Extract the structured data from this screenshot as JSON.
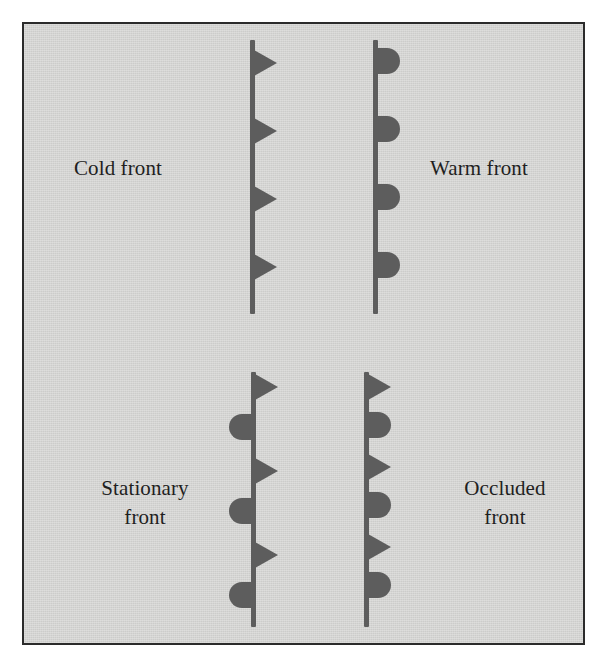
{
  "figure": {
    "background_color": "#d4d4d2",
    "border_color": "#2b2b2b",
    "symbol_color": "#5d5d5d",
    "text_color": "#1f1f1f"
  },
  "fronts": [
    {
      "id": "cold-front",
      "label": "Cold front",
      "label_lines": [
        "Cold front"
      ],
      "description": "Solid line with filled triangles (pips) on one side, pointing in the direction of motion.",
      "line": {
        "x": 248,
        "y_top": 38,
        "y_bottom": 312
      },
      "label_pos": {
        "x": 72,
        "y": 152,
        "align": "left"
      },
      "symbols": [
        {
          "shape": "triangle",
          "side": "right",
          "y": 48
        },
        {
          "shape": "triangle",
          "side": "right",
          "y": 116
        },
        {
          "shape": "triangle",
          "side": "right",
          "y": 184
        },
        {
          "shape": "triangle",
          "side": "right",
          "y": 252
        }
      ]
    },
    {
      "id": "warm-front",
      "label": "Warm front",
      "label_lines": [
        "Warm front"
      ],
      "description": "Solid line with filled semicircles on one side, facing the direction of motion.",
      "line": {
        "x": 371,
        "y_top": 38,
        "y_bottom": 312
      },
      "label_pos": {
        "x": 428,
        "y": 152,
        "align": "left"
      },
      "symbols": [
        {
          "shape": "semicircle",
          "side": "right",
          "y": 46
        },
        {
          "shape": "semicircle",
          "side": "right",
          "y": 114
        },
        {
          "shape": "semicircle",
          "side": "right",
          "y": 182
        },
        {
          "shape": "semicircle",
          "side": "right",
          "y": 250
        }
      ]
    },
    {
      "id": "stationary-front",
      "label": "Stationary front",
      "label_lines": [
        "Stationary",
        "front"
      ],
      "description": "Alternating triangles on one side and semicircles on the opposite side.",
      "line": {
        "x": 249,
        "y_top": 370,
        "y_bottom": 625
      },
      "label_pos": {
        "x": 68,
        "y": 472,
        "align": "center"
      },
      "symbols": [
        {
          "shape": "triangle",
          "side": "right",
          "y": 372
        },
        {
          "shape": "semicircle",
          "side": "left",
          "y": 412
        },
        {
          "shape": "triangle",
          "side": "right",
          "y": 456
        },
        {
          "shape": "semicircle",
          "side": "left",
          "y": 496
        },
        {
          "shape": "triangle",
          "side": "right",
          "y": 540
        },
        {
          "shape": "semicircle",
          "side": "left",
          "y": 580
        }
      ]
    },
    {
      "id": "occluded-front",
      "label": "Occluded front",
      "label_lines": [
        "Occluded",
        "front"
      ],
      "description": "Alternating triangles and semicircles on the same side of the line.",
      "line": {
        "x": 362,
        "y_top": 370,
        "y_bottom": 625
      },
      "label_pos": {
        "x": 428,
        "y": 472,
        "align": "center"
      },
      "symbols": [
        {
          "shape": "triangle",
          "side": "right",
          "y": 372
        },
        {
          "shape": "semicircle",
          "side": "right",
          "y": 410
        },
        {
          "shape": "triangle",
          "side": "right",
          "y": 452
        },
        {
          "shape": "semicircle",
          "side": "right",
          "y": 490
        },
        {
          "shape": "triangle",
          "side": "right",
          "y": 532
        },
        {
          "shape": "semicircle",
          "side": "right",
          "y": 570
        }
      ]
    }
  ]
}
